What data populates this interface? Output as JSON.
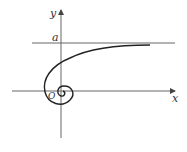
{
  "diagram": {
    "type": "spiral-curve-with-asymptote",
    "labels": {
      "y_axis": "y",
      "x_axis": "x",
      "asymptote": "a",
      "origin": "O"
    },
    "colors": {
      "axis": "#555555",
      "curve": "#222222",
      "asymptote": "#555555"
    }
  }
}
